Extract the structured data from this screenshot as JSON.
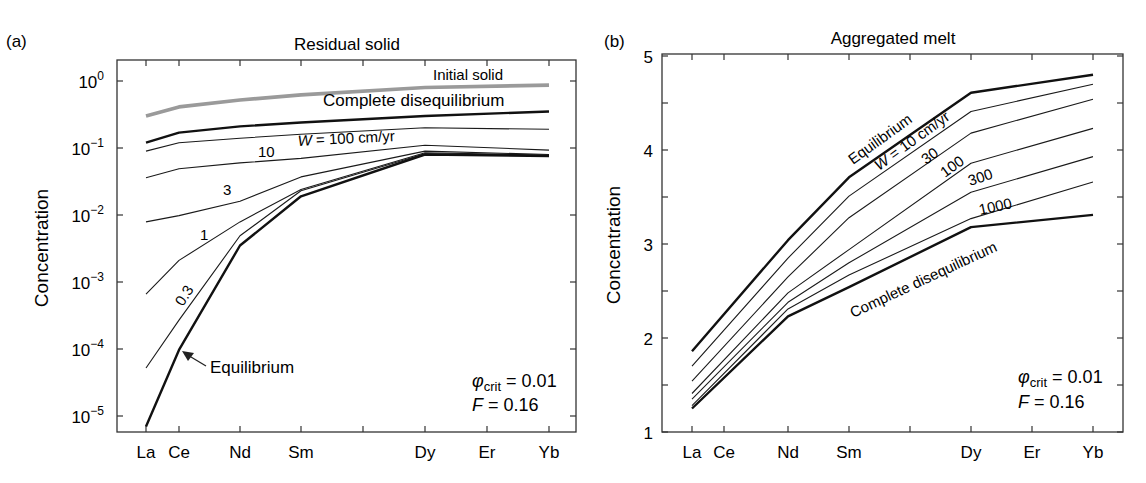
{
  "chart_data": [
    {
      "panel": "(a)",
      "type": "line",
      "title": "Residual solid",
      "xlabel": "",
      "ylabel": "Concentration",
      "yscale": "log",
      "ylim": [
        5e-06,
        1.3
      ],
      "yticks": [
        "10^0",
        "10^-1",
        "10^-2",
        "10^-3",
        "10^-4",
        "10^-5"
      ],
      "categories": [
        "La",
        "Ce",
        "Nd",
        "Sm",
        "",
        "Dy",
        "Er",
        "Yb"
      ],
      "x_positions": [
        "La",
        "Ce",
        "Nd",
        "Sm",
        "Dy",
        "Yb"
      ],
      "grid": false,
      "series": [
        {
          "name": "Initial solid",
          "style": "gray-thick",
          "values": [
            0.3,
            0.41,
            0.52,
            0.62,
            0.8,
            0.87
          ]
        },
        {
          "name": "Complete disequilibrium",
          "style": "thick",
          "values": [
            0.12,
            0.17,
            0.21,
            0.24,
            0.3,
            0.35
          ]
        },
        {
          "name": "W = 100 cm/yr",
          "style": "thin",
          "values": [
            0.09,
            0.12,
            0.14,
            0.16,
            0.2,
            0.19
          ]
        },
        {
          "name": "10",
          "style": "thin",
          "values": [
            0.036,
            0.049,
            0.06,
            0.07,
            0.11,
            0.093
          ]
        },
        {
          "name": "3",
          "style": "thin",
          "values": [
            0.0079,
            0.0098,
            0.016,
            0.037,
            0.09,
            0.08
          ]
        },
        {
          "name": "1",
          "style": "thin",
          "values": [
            0.00066,
            0.0021,
            0.0079,
            0.024,
            0.085,
            0.078
          ]
        },
        {
          "name": "0.3",
          "style": "thin",
          "values": [
            5.2e-05,
            0.00027,
            0.0049,
            0.023,
            0.082,
            0.077
          ]
        },
        {
          "name": "Equilibrium",
          "style": "thick",
          "values": [
            7e-06,
            9.7e-05,
            0.0035,
            0.019,
            0.08,
            0.076
          ]
        }
      ],
      "annotations": {
        "initial_solid": "Initial solid",
        "complete_diseq": "Complete disequilibrium",
        "w100": "W = 100 cm/yr",
        "w10": "10",
        "w3": "3",
        "w1": "1",
        "w03": "0.3",
        "equilibrium": "Equilibrium",
        "phi": "φ",
        "phi_sub": "crit",
        "phi_val": " = 0.01",
        "f": "F",
        "f_val": " = 0.16"
      }
    },
    {
      "panel": "(b)",
      "type": "line",
      "title": "Aggregated melt",
      "xlabel": "",
      "ylabel": "Concentration",
      "yscale": "linear",
      "ylim": [
        1,
        5
      ],
      "yticks": [
        "1",
        "2",
        "3",
        "4",
        "5"
      ],
      "categories": [
        "La",
        "Ce",
        "Nd",
        "Sm",
        "",
        "Dy",
        "Er",
        "Yb"
      ],
      "x_positions": [
        "La",
        "Nd",
        "Sm",
        "Dy",
        "Yb"
      ],
      "grid": false,
      "series": [
        {
          "name": "Equilibrium",
          "style": "thick",
          "values": [
            1.86,
            3.04,
            3.71,
            4.61,
            4.8
          ]
        },
        {
          "name": "W = 10 cm/yr",
          "style": "thin",
          "values": [
            1.7,
            2.85,
            3.51,
            4.41,
            4.7
          ]
        },
        {
          "name": "30",
          "style": "thin",
          "values": [
            1.54,
            2.65,
            3.28,
            4.18,
            4.54
          ]
        },
        {
          "name": "100",
          "style": "thin",
          "values": [
            1.41,
            2.48,
            2.94,
            3.86,
            4.23
          ]
        },
        {
          "name": "300",
          "style": "thin",
          "values": [
            1.35,
            2.38,
            2.8,
            3.55,
            3.93
          ]
        },
        {
          "name": "1000",
          "style": "thin",
          "values": [
            1.28,
            2.31,
            2.67,
            3.27,
            3.66
          ]
        },
        {
          "name": "Complete disequilibrium",
          "style": "thick",
          "values": [
            1.25,
            2.23,
            2.54,
            3.18,
            3.31
          ]
        }
      ],
      "annotations": {
        "equilibrium": "Equilibrium",
        "w10": "W = 10 cm/yr",
        "w30": "30",
        "w100": "100",
        "w300": "300",
        "w1000": "1000",
        "complete_diseq": "Complete disequilibrium",
        "phi": "φ",
        "phi_sub": "crit",
        "phi_val": " = 0.01",
        "f": "F",
        "f_val": " = 0.16"
      }
    }
  ]
}
